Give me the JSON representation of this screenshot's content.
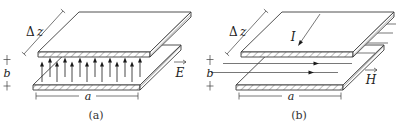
{
  "figure_type": "parallel-plate transmission line field diagrams",
  "colors": {
    "background": "#ffffff",
    "line": "#3d3d3d",
    "arrow_fill": "#1a1a1a",
    "text": "#222222"
  },
  "panels": [
    {
      "caption": "(a)",
      "depth_label_delta": "Δ",
      "depth_label_var": "z",
      "gap_label": "b",
      "width_label": "a",
      "field_label": "E"
    },
    {
      "caption": "(b)",
      "depth_label_delta": "Δ",
      "depth_label_var": "z",
      "gap_label": "b",
      "width_label": "a",
      "current_label": "I",
      "field_label": "H"
    }
  ]
}
